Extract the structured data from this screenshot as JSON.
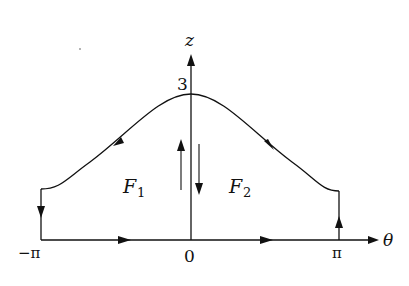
{
  "diagram": {
    "axes": {
      "x_label": "θ",
      "y_label": "z",
      "x_ticks": [
        "−π",
        "0",
        "π"
      ],
      "y_tick": "3"
    },
    "regions": [
      {
        "label": "F",
        "subscript": "1"
      },
      {
        "label": "F",
        "subscript": "2"
      }
    ]
  }
}
